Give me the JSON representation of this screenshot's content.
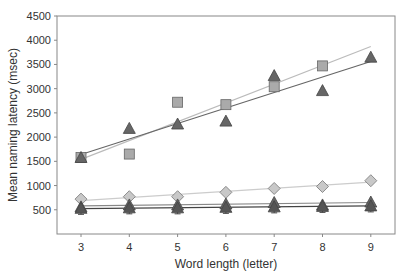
{
  "chart_data": {
    "type": "scatter",
    "title": "",
    "xlabel": "Word length (letter)",
    "ylabel": "Mean naming latency (msec)",
    "xlim": [
      2.5,
      9.5
    ],
    "ylim": [
      0,
      4500
    ],
    "x_ticks": [
      3,
      4,
      5,
      6,
      7,
      8,
      9
    ],
    "y_ticks": [
      500,
      1000,
      1500,
      2000,
      2500,
      3000,
      3500,
      4000,
      4500
    ],
    "grid": false,
    "legend": "none",
    "series": [
      {
        "name": "squares",
        "marker": "square",
        "color": "#aaaaaa",
        "trendline_color": "#bbbbbb",
        "x": [
          3,
          4,
          5,
          6,
          7,
          8
        ],
        "values": [
          1580,
          1650,
          2720,
          2670,
          3040,
          3470
        ],
        "trendline": {
          "x": [
            3,
            9
          ],
          "y": [
            1540,
            3870
          ]
        }
      },
      {
        "name": "triangles-high",
        "marker": "triangle",
        "color": "#666666",
        "trendline_color": "#666666",
        "x": [
          3,
          4,
          5,
          6,
          7,
          8,
          9
        ],
        "values": [
          1580,
          2180,
          2270,
          2330,
          3270,
          2960,
          3650
        ],
        "trendline": {
          "x": [
            3,
            9
          ],
          "y": [
            1640,
            3560
          ]
        }
      },
      {
        "name": "diamonds",
        "marker": "diamond",
        "color": "#c8c8c8",
        "trendline_color": "#cccccc",
        "x": [
          3,
          4,
          5,
          6,
          7,
          8,
          9
        ],
        "values": [
          720,
          770,
          770,
          860,
          940,
          980,
          1100
        ],
        "trendline": {
          "x": [
            3,
            9
          ],
          "y": [
            690,
            1070
          ]
        }
      },
      {
        "name": "triangles-mid",
        "marker": "triangle",
        "color": "#666666",
        "trendline_color": "#888888",
        "x": [
          3,
          4,
          5,
          6,
          7,
          8,
          9
        ],
        "values": [
          560,
          600,
          600,
          620,
          650,
          600,
          660
        ],
        "trendline": {
          "x": [
            3,
            9
          ],
          "y": [
            580,
            650
          ]
        }
      },
      {
        "name": "triangles-low",
        "marker": "triangle",
        "color": "#555555",
        "trendline_color": "#444444",
        "x": [
          3,
          4,
          5,
          6,
          7,
          8,
          9
        ],
        "values": [
          530,
          540,
          540,
          550,
          560,
          570,
          580
        ],
        "error_bars": true,
        "trendline": {
          "x": [
            3,
            9
          ],
          "y": [
            525,
            580
          ]
        }
      }
    ]
  }
}
